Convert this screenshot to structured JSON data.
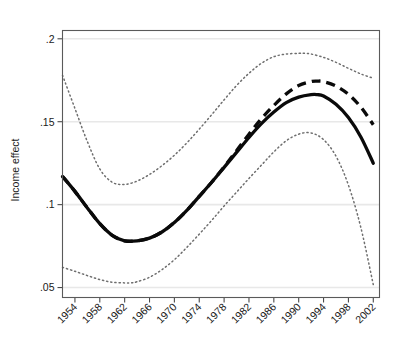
{
  "chart_data": {
    "type": "line",
    "title": "",
    "subtitle": "",
    "xlabel": "",
    "ylabel": "Income effect",
    "xlim": [
      1952,
      2003
    ],
    "ylim": [
      0.044,
      0.205
    ],
    "grid": true,
    "grid_axis": "y",
    "legend": "none",
    "x_tick_rotation": 45,
    "xticks": [
      1954,
      1958,
      1962,
      1966,
      1970,
      1974,
      1978,
      1982,
      1986,
      1990,
      1994,
      1998,
      2002
    ],
    "xtick_labels": [
      "1954",
      "1958",
      "1962",
      "1966",
      "1970",
      "1974",
      "1978",
      "1982",
      "1986",
      "1990",
      "1994",
      "1998",
      "2002"
    ],
    "yticks": [
      0.05,
      0.1,
      0.15,
      0.2
    ],
    "ytick_labels": [
      ".05",
      ".1",
      ".15",
      ".2"
    ],
    "series": [
      {
        "name": "income-effect-estimate",
        "style": "solid",
        "color": "#0a0a0a",
        "x": [
          1952,
          1954,
          1956,
          1958,
          1960,
          1962,
          1964,
          1966,
          1968,
          1970,
          1972,
          1974,
          1976,
          1978,
          1980,
          1982,
          1984,
          1986,
          1988,
          1990,
          1992,
          1993,
          1994,
          1996,
          1998,
          2000,
          2002
        ],
        "values": [
          0.117,
          0.108,
          0.098,
          0.0885,
          0.0815,
          0.0782,
          0.0782,
          0.0798,
          0.0835,
          0.0892,
          0.0965,
          0.105,
          0.1135,
          0.1225,
          0.1315,
          0.1405,
          0.1488,
          0.1558,
          0.1615,
          0.1648,
          0.1663,
          0.1663,
          0.1655,
          0.1605,
          0.1525,
          0.1408,
          0.125
        ]
      },
      {
        "name": "income-effect-alternative",
        "style": "dashed",
        "color": "#0a0a0a",
        "x": [
          1952,
          1954,
          1956,
          1958,
          1960,
          1962,
          1964,
          1966,
          1968,
          1970,
          1972,
          1974,
          1976,
          1978,
          1980,
          1982,
          1984,
          1986,
          1988,
          1990,
          1992,
          1993,
          1994,
          1996,
          1998,
          2000,
          2002
        ],
        "values": [
          0.117,
          0.108,
          0.098,
          0.0885,
          0.0815,
          0.0782,
          0.0782,
          0.0798,
          0.0835,
          0.0892,
          0.0965,
          0.105,
          0.1135,
          0.1228,
          0.1325,
          0.1425,
          0.1518,
          0.1598,
          0.1668,
          0.1718,
          0.1742,
          0.1745,
          0.1742,
          0.1715,
          0.1665,
          0.1588,
          0.1482
        ]
      },
      {
        "name": "confidence-band-upper",
        "style": "dotted",
        "color": "#6e6e6e",
        "x": [
          1952,
          1954,
          1956,
          1958,
          1960,
          1962,
          1964,
          1966,
          1968,
          1970,
          1972,
          1974,
          1976,
          1978,
          1980,
          1982,
          1984,
          1986,
          1988,
          1990,
          1991,
          1992,
          1994,
          1996,
          1998,
          2000,
          2002
        ],
        "values": [
          0.178,
          0.158,
          0.138,
          0.1215,
          0.1135,
          0.1122,
          0.1142,
          0.1182,
          0.1235,
          0.1298,
          0.1372,
          0.1455,
          0.1542,
          0.1632,
          0.1718,
          0.1792,
          0.1852,
          0.1892,
          0.1908,
          0.1912,
          0.1912,
          0.1908,
          0.1888,
          0.1858,
          0.1822,
          0.1788,
          0.1762
        ]
      },
      {
        "name": "confidence-band-lower",
        "style": "dotted",
        "color": "#6e6e6e",
        "x": [
          1952,
          1954,
          1956,
          1958,
          1960,
          1962,
          1963,
          1964,
          1966,
          1968,
          1970,
          1972,
          1974,
          1976,
          1978,
          1980,
          1982,
          1984,
          1986,
          1988,
          1990,
          1992,
          1994,
          1996,
          1998,
          2000,
          2002
        ],
        "values": [
          0.0622,
          0.0598,
          0.0572,
          0.0548,
          0.0532,
          0.0528,
          0.0528,
          0.0535,
          0.0562,
          0.0608,
          0.0668,
          0.0742,
          0.0822,
          0.0905,
          0.0992,
          0.1075,
          0.1158,
          0.1238,
          0.1318,
          0.1385,
          0.1425,
          0.1432,
          0.1392,
          0.1292,
          0.1118,
          0.0862,
          0.0518
        ]
      }
    ]
  },
  "axis": {
    "y_title": "Income effect"
  }
}
